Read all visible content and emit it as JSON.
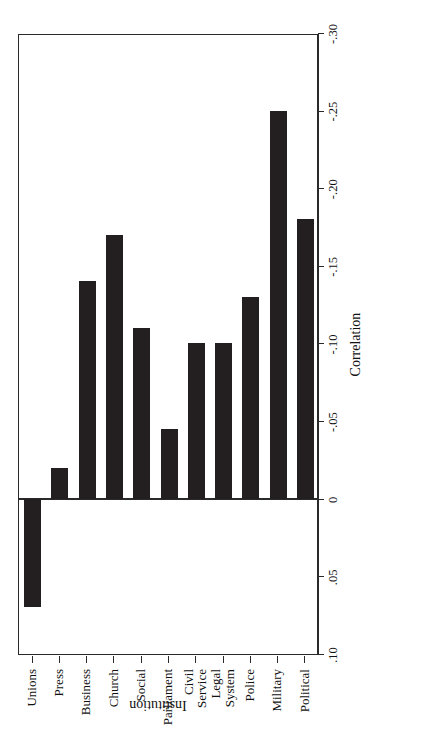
{
  "chart_data": {
    "type": "bar",
    "orientation": "horizontal-rotated",
    "title": "",
    "xlabel": "Institution",
    "ylabel": "Correlation",
    "categories": [
      "Political",
      "Military",
      "Police",
      "Legal System",
      "Civil Service",
      "Parliament",
      "Social",
      "Church",
      "Business",
      "Press",
      "Unions"
    ],
    "category_label_lines": [
      [
        "Political"
      ],
      [
        "Military"
      ],
      [
        "Police"
      ],
      [
        "Legal",
        "System"
      ],
      [
        "Civil",
        "Service"
      ],
      [
        "Parliament"
      ],
      [
        "Social"
      ],
      [
        "Church"
      ],
      [
        "Business"
      ],
      [
        "Press"
      ],
      [
        "Unions"
      ]
    ],
    "values": [
      -0.18,
      -0.25,
      -0.13,
      -0.1,
      -0.1,
      -0.045,
      -0.11,
      -0.17,
      -0.14,
      -0.02,
      0.07
    ],
    "value_axis": {
      "min": 0.1,
      "max": -0.3,
      "direction": "descending",
      "tick_values": [
        0.1,
        0.05,
        0.0,
        -0.05,
        -0.1,
        -0.15,
        -0.2,
        -0.25,
        -0.3
      ],
      "tick_labels": [
        ".10",
        ".05",
        "0",
        "-.05",
        "-.10",
        "-.15",
        "-.20",
        "-.25",
        "-.30"
      ]
    },
    "grid": false,
    "legend": null,
    "bar_color": "#231f20",
    "axis_color": "#2a2a2a",
    "background": "#ffffff"
  }
}
